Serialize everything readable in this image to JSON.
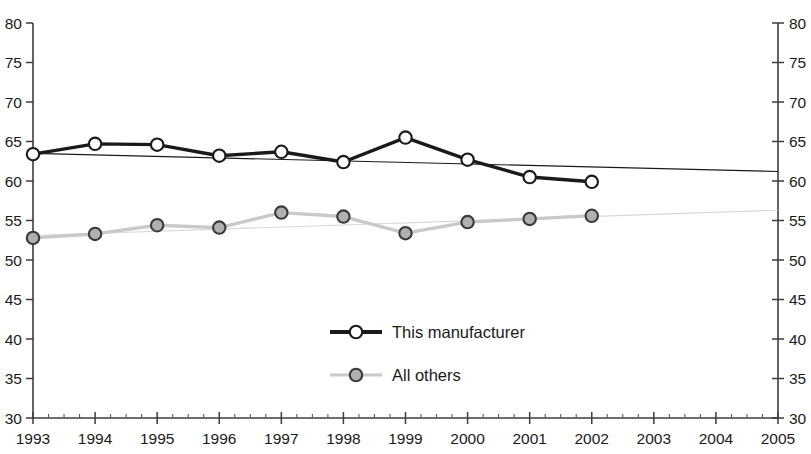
{
  "chart_data": {
    "type": "line",
    "title": "",
    "subtitle": "",
    "xlabel": "",
    "ylabel": "",
    "xlim": [
      1993,
      2005
    ],
    "ylim": [
      30,
      80
    ],
    "ytick_interval": 5,
    "xtick_interval": 1,
    "minor_ticks_per_interval": 4,
    "grid": false,
    "dual_y_axis": true,
    "legend_position": "center",
    "x": [
      1993,
      1994,
      1995,
      1996,
      1997,
      1998,
      1999,
      2000,
      2001,
      2002
    ],
    "categories": [
      "1993",
      "1994",
      "1995",
      "1996",
      "1997",
      "1998",
      "1999",
      "2000",
      "2001",
      "2002"
    ],
    "xtick_labels": [
      "1993",
      "1994",
      "1995",
      "1996",
      "1997",
      "1998",
      "1999",
      "2000",
      "2001",
      "2002",
      "2003",
      "2004",
      "2005"
    ],
    "ytick_labels_left": [
      "80",
      "75",
      "70",
      "65",
      "60",
      "55",
      "50",
      "45",
      "40",
      "35",
      "30"
    ],
    "ytick_labels_right": [
      "80",
      "75",
      "70",
      "65",
      "60",
      "55",
      "50",
      "45",
      "40",
      "35",
      "30"
    ],
    "series": [
      {
        "name": "This manufacturer",
        "color": "#1a1a1a",
        "marker": "circle-open",
        "marker_fill": "#ffffff",
        "line_width": 3.4,
        "values": [
          63.4,
          64.7,
          64.6,
          63.2,
          63.7,
          62.4,
          65.5,
          62.7,
          60.5,
          59.9
        ],
        "trendline": {
          "visible": true,
          "color": "#1a1a1a",
          "line_width": 1.2,
          "x_start": 1993,
          "x_end": 2005,
          "y_start": 63.5,
          "y_end": 61.2
        }
      },
      {
        "name": "All others",
        "color": "#c9c9c9",
        "marker": "circle-filled",
        "marker_fill": "#b0b0b0",
        "marker_edge": "#3a3a3a",
        "line_width": 3.4,
        "values": [
          52.8,
          53.3,
          54.4,
          54.1,
          56.0,
          55.5,
          53.4,
          54.8,
          55.2,
          55.6
        ],
        "trendline": {
          "visible": true,
          "color": "#d8d8d8",
          "line_width": 1.2,
          "x_start": 1993,
          "x_end": 2005,
          "y_start": 53.1,
          "y_end": 56.3
        }
      }
    ],
    "legend": [
      {
        "label": "This manufacturer",
        "color": "#1a1a1a",
        "marker": "circle-open",
        "marker_fill": "#ffffff"
      },
      {
        "label": "All others",
        "color": "#c9c9c9",
        "marker": "circle-filled",
        "marker_fill": "#b0b0b0"
      }
    ]
  }
}
